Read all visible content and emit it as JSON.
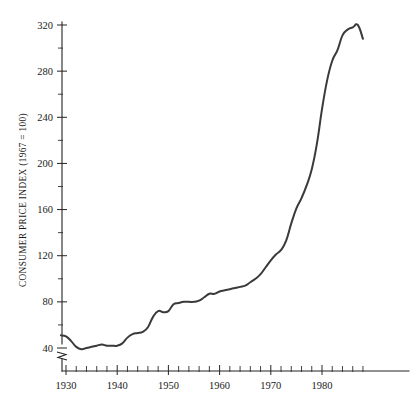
{
  "chart_data": {
    "type": "line",
    "title": "",
    "subtitle": "",
    "xlabel": "",
    "ylabel": "CONSUMER PRICE INDEX (1967 = 100)",
    "xlim": [
      1929,
      1989
    ],
    "ylim": [
      30,
      325
    ],
    "grid": false,
    "legend": "none",
    "axis_break_y": true,
    "y_ticks_major": [
      40,
      80,
      120,
      160,
      200,
      240,
      280,
      320
    ],
    "y_tick_labels": [
      "40",
      "80",
      "120",
      "160",
      "200",
      "240",
      "280",
      "320"
    ],
    "y_ticks_minor": [
      60,
      100,
      140,
      180,
      220,
      260,
      300
    ],
    "x_ticks_major": [
      1930,
      1940,
      1950,
      1960,
      1970,
      1980
    ],
    "x_tick_labels": [
      "1930",
      "1940",
      "1950",
      "1960",
      "1970",
      "1980"
    ],
    "x_ticks_minor": [
      1932,
      1934,
      1936,
      1938,
      1942,
      1944,
      1946,
      1948,
      1952,
      1954,
      1956,
      1958,
      1962,
      1964,
      1966,
      1968,
      1972,
      1974,
      1976,
      1978,
      1982,
      1984,
      1986,
      1988
    ],
    "x": [
      1929,
      1930,
      1931,
      1932,
      1933,
      1934,
      1935,
      1936,
      1937,
      1938,
      1939,
      1940,
      1941,
      1942,
      1943,
      1944,
      1945,
      1946,
      1947,
      1948,
      1949,
      1950,
      1951,
      1952,
      1953,
      1954,
      1955,
      1956,
      1957,
      1958,
      1959,
      1960,
      1961,
      1962,
      1963,
      1964,
      1965,
      1966,
      1967,
      1968,
      1969,
      1970,
      1971,
      1972,
      1973,
      1974,
      1975,
      1976,
      1977,
      1978,
      1979,
      1980,
      1981,
      1982,
      1983,
      1984,
      1985,
      1986,
      1987,
      1988
    ],
    "y": [
      51.3,
      50.0,
      45.6,
      40.9,
      38.8,
      40.1,
      41.1,
      41.5,
      43.0,
      42.2,
      41.6,
      42.0,
      44.1,
      48.8,
      51.8,
      52.7,
      53.9,
      58.5,
      66.9,
      72.1,
      71.4,
      72.1,
      77.8,
      79.5,
      80.1,
      80.5,
      80.2,
      81.4,
      84.3,
      86.6,
      87.3,
      88.7,
      89.6,
      90.6,
      91.7,
      92.9,
      94.5,
      97.2,
      100.0,
      104.2,
      109.8,
      116.3,
      121.3,
      125.3,
      133.1,
      147.7,
      161.2,
      170.5,
      181.5,
      195.4,
      217.4,
      246.8,
      272.4,
      289.1,
      298.4,
      311.1,
      322.2,
      328.4,
      340.4,
      354.3
    ],
    "y_plotted": [
      51,
      50,
      46,
      41,
      39,
      40,
      41,
      42,
      43,
      42,
      42,
      42,
      44,
      49,
      52,
      53,
      54,
      58,
      67,
      72,
      71,
      72,
      78,
      79,
      80,
      80,
      80,
      81,
      84,
      87,
      87,
      89,
      90,
      91,
      92,
      93,
      94,
      97,
      100,
      104,
      110,
      116,
      121,
      125,
      133,
      148,
      161,
      170,
      181,
      195,
      217,
      247,
      272,
      289,
      298,
      311,
      316,
      318,
      320,
      308
    ],
    "line_color": "#3a3a3a",
    "background_color": "#ffffff"
  }
}
